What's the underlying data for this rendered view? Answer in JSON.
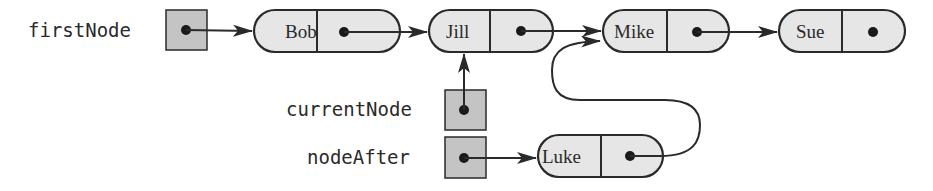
{
  "diagram": {
    "type": "linked-list-insertion",
    "colors": {
      "stroke": "#2a2a2a",
      "node_fill": "#e6e6e6",
      "ref_box_fill": "#c4c4c4",
      "background": "#ffffff"
    },
    "variables": [
      {
        "id": "firstNode",
        "label": "firstNode",
        "points_to": "Bob"
      },
      {
        "id": "currentNode",
        "label": "currentNode",
        "points_to": "Jill"
      },
      {
        "id": "nodeAfter",
        "label": "nodeAfter",
        "points_to": "Luke"
      }
    ],
    "nodes": [
      {
        "id": "Bob",
        "data": "Bob",
        "next": "Jill"
      },
      {
        "id": "Jill",
        "data": "Jill",
        "next": "Mike"
      },
      {
        "id": "Mike",
        "data": "Mike",
        "next": "Sue"
      },
      {
        "id": "Sue",
        "data": "Sue",
        "next": null
      },
      {
        "id": "Luke",
        "data": "Luke",
        "next": "Mike"
      }
    ]
  }
}
